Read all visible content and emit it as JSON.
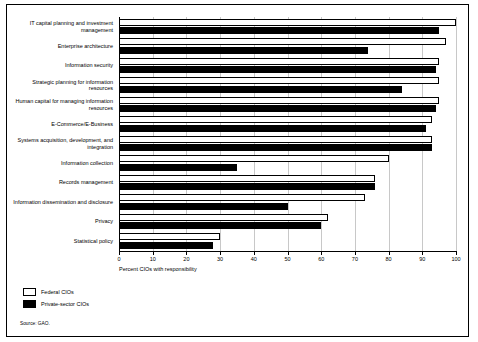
{
  "chart_data": {
    "type": "bar",
    "orientation": "horizontal",
    "title": "",
    "xlabel": "Percent CIOs with responsibility",
    "ylabel": "",
    "xlim": [
      0,
      100
    ],
    "xticks": [
      0,
      10,
      20,
      30,
      40,
      50,
      60,
      70,
      80,
      90,
      100
    ],
    "grid": true,
    "legend_position": "bottom-left",
    "categories": [
      "IT capital planning and investment management",
      "Enterprise architecture",
      "Information security",
      "Strategic planning for information resources",
      "Human capital for managing information resources",
      "E-Commerce/E-Business",
      "Systems acquisition, development, and integration",
      "Information collection",
      "Records management",
      "Information dissemination and disclosure",
      "Privacy",
      "Statistical policy"
    ],
    "series": [
      {
        "name": "Federal CIOs",
        "color": "#ffffff",
        "values": [
          100,
          97,
          95,
          95,
          95,
          93,
          93,
          80,
          76,
          73,
          62,
          30
        ]
      },
      {
        "name": "Private-sector CIOs",
        "color": "#000000",
        "values": [
          95,
          74,
          94,
          84,
          94,
          91,
          93,
          35,
          76,
          50,
          60,
          28
        ]
      }
    ],
    "source": "Source: GAO."
  },
  "legend": {
    "federal_label": "Federal CIOs",
    "private_label": "Private-sector CIOs"
  }
}
